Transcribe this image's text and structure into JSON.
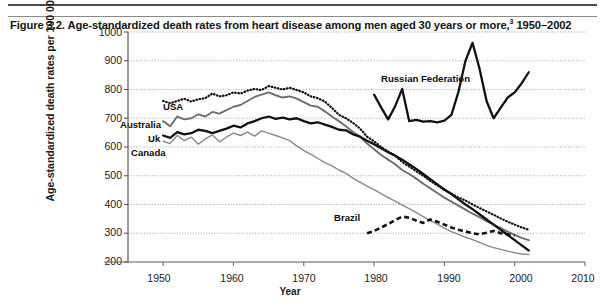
{
  "figure": {
    "title_main": "Figure 3.2. Age-standardized death rates from heart disease among men aged 30 years or more,",
    "title_sup": "3",
    "title_years": " 1950–2002"
  },
  "axes": {
    "ylabel": "Age-standardized death rates per 100 000",
    "xlabel": "Year",
    "yticks": [
      "1000",
      "900",
      "800",
      "700",
      "600",
      "500",
      "400",
      "300",
      "200"
    ],
    "xticks": [
      "1950",
      "1960",
      "1970",
      "1980",
      "1990",
      "2000",
      "2010"
    ]
  },
  "series_labels": {
    "usa": "USA",
    "australia": "Australia",
    "uk": "Uk",
    "canada": "Canada",
    "russia": "Russian Federation",
    "brazil": "Brazil"
  },
  "chart_data": {
    "type": "line",
    "title": "Figure 3.2. Age-standardized death rates from heart disease among men aged 30 years or more,3 1950–2002",
    "xlabel": "Year",
    "ylabel": "Age-standardized death rates per 100 000",
    "xlim": [
      1945,
      2010
    ],
    "ylim": [
      200,
      1000
    ],
    "yticks": [
      200,
      300,
      400,
      500,
      600,
      700,
      800,
      900,
      1000
    ],
    "xticks": [
      1950,
      1960,
      1970,
      1980,
      1990,
      2000,
      2010
    ],
    "grid": "horizontal-dotted",
    "legend": "inline-labels",
    "series": [
      {
        "name": "USA",
        "style": "dotted",
        "color": "#111111",
        "x": [
          1950,
          1951,
          1952,
          1953,
          1954,
          1955,
          1956,
          1957,
          1958,
          1959,
          1960,
          1961,
          1962,
          1963,
          1964,
          1965,
          1966,
          1967,
          1968,
          1969,
          1970,
          1971,
          1972,
          1973,
          1974,
          1975,
          1976,
          1977,
          1978,
          1979,
          1980,
          1981,
          1982,
          1983,
          1984,
          1985,
          1986,
          1987,
          1988,
          1989,
          1990,
          1991,
          1992,
          1993,
          1994,
          1995,
          1996,
          1997,
          1998,
          1999,
          2000,
          2001,
          2002
        ],
        "y": [
          760,
          752,
          760,
          768,
          758,
          766,
          770,
          786,
          776,
          780,
          790,
          786,
          796,
          802,
          798,
          812,
          806,
          800,
          806,
          798,
          790,
          776,
          770,
          758,
          736,
          712,
          700,
          684,
          664,
          636,
          620,
          600,
          584,
          570,
          548,
          532,
          516,
          500,
          482,
          466,
          450,
          438,
          424,
          414,
          400,
          388,
          376,
          364,
          352,
          340,
          330,
          320,
          312
        ]
      },
      {
        "name": "Australia",
        "style": "solid-gray",
        "color": "#6e6e6e",
        "x": [
          1950,
          1951,
          1952,
          1953,
          1954,
          1955,
          1956,
          1957,
          1958,
          1959,
          1960,
          1961,
          1962,
          1963,
          1964,
          1965,
          1966,
          1967,
          1968,
          1969,
          1970,
          1971,
          1972,
          1973,
          1974,
          1975,
          1976,
          1977,
          1978,
          1979,
          1980,
          1981,
          1982,
          1983,
          1984,
          1985,
          1986,
          1987,
          1988,
          1989,
          1990,
          1991,
          1992,
          1993,
          1994,
          1995,
          1996,
          1997,
          1998,
          1999,
          2000,
          2001,
          2002
        ],
        "y": [
          690,
          672,
          706,
          696,
          700,
          714,
          706,
          722,
          716,
          728,
          740,
          746,
          760,
          774,
          782,
          790,
          780,
          772,
          776,
          768,
          756,
          744,
          740,
          724,
          706,
          690,
          672,
          652,
          636,
          612,
          592,
          572,
          556,
          540,
          520,
          506,
          490,
          472,
          456,
          440,
          424,
          410,
          396,
          382,
          368,
          356,
          342,
          330,
          318,
          306,
          294,
          284,
          276
        ]
      },
      {
        "name": "Uk",
        "style": "solid-black-thick",
        "color": "#121212",
        "x": [
          1950,
          1951,
          1952,
          1953,
          1954,
          1955,
          1956,
          1957,
          1958,
          1959,
          1960,
          1961,
          1962,
          1963,
          1964,
          1965,
          1966,
          1967,
          1968,
          1969,
          1970,
          1971,
          1972,
          1973,
          1974,
          1975,
          1976,
          1977,
          1978,
          1979,
          1980,
          1981,
          1982,
          1983,
          1984,
          1985,
          1986,
          1987,
          1988,
          1989,
          1990,
          1991,
          1992,
          1993,
          1994,
          1995,
          1996,
          1997,
          1998,
          1999,
          2000,
          2001,
          2002
        ],
        "y": [
          640,
          632,
          652,
          644,
          648,
          660,
          656,
          648,
          656,
          664,
          674,
          668,
          682,
          690,
          700,
          706,
          698,
          702,
          696,
          700,
          690,
          682,
          686,
          678,
          670,
          660,
          658,
          644,
          636,
          622,
          610,
          596,
          582,
          570,
          556,
          540,
          524,
          506,
          488,
          470,
          452,
          436,
          418,
          400,
          384,
          366,
          348,
          330,
          312,
          294,
          276,
          258,
          240
        ]
      },
      {
        "name": "Canada",
        "style": "solid-gray-thin",
        "color": "#8a8a8a",
        "x": [
          1950,
          1951,
          1952,
          1953,
          1954,
          1955,
          1956,
          1957,
          1958,
          1959,
          1960,
          1961,
          1962,
          1963,
          1964,
          1965,
          1966,
          1967,
          1968,
          1969,
          1970,
          1971,
          1972,
          1973,
          1974,
          1975,
          1976,
          1977,
          1978,
          1979,
          1980,
          1981,
          1982,
          1983,
          1984,
          1985,
          1986,
          1987,
          1988,
          1989,
          1990,
          1991,
          1992,
          1993,
          1994,
          1995,
          1996,
          1997,
          1998,
          1999,
          2000,
          2001,
          2002
        ],
        "y": [
          620,
          612,
          640,
          622,
          634,
          610,
          628,
          642,
          618,
          634,
          648,
          640,
          652,
          638,
          656,
          648,
          640,
          632,
          622,
          604,
          588,
          574,
          560,
          546,
          534,
          520,
          508,
          492,
          478,
          464,
          452,
          438,
          424,
          412,
          398,
          386,
          372,
          358,
          344,
          332,
          318,
          306,
          296,
          286,
          278,
          268,
          258,
          250,
          244,
          238,
          232,
          228,
          226
        ]
      },
      {
        "name": "Russian Federation",
        "style": "solid-black-thick",
        "color": "#121212",
        "x": [
          1980,
          1981,
          1982,
          1983,
          1984,
          1985,
          1986,
          1987,
          1988,
          1989,
          1990,
          1991,
          1992,
          1993,
          1994,
          1995,
          1996,
          1997,
          1998,
          1999,
          2000,
          2001,
          2002
        ],
        "y": [
          782,
          738,
          696,
          742,
          802,
          690,
          694,
          688,
          690,
          686,
          692,
          712,
          792,
          900,
          962,
          872,
          760,
          700,
          736,
          772,
          790,
          822,
          860
        ]
      },
      {
        "name": "Brazil",
        "style": "dashed-black-thick",
        "color": "#121212",
        "x": [
          1979,
          1980,
          1981,
          1982,
          1983,
          1984,
          1985,
          1986,
          1987,
          1988,
          1989,
          1990,
          1991,
          1992,
          1993,
          1994,
          1995,
          1996,
          1997,
          1998,
          1999,
          2000
        ],
        "y": [
          300,
          308,
          320,
          332,
          346,
          358,
          354,
          344,
          336,
          348,
          340,
          330,
          320,
          312,
          306,
          300,
          296,
          302,
          308,
          300,
          296,
          292
        ]
      }
    ]
  }
}
